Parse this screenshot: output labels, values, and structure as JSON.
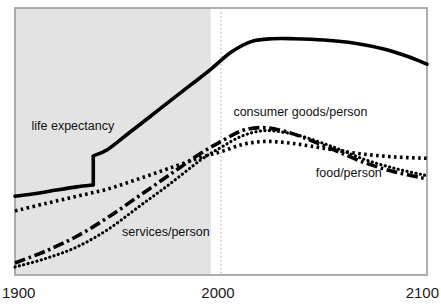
{
  "chart_data": {
    "type": "line",
    "title": "",
    "xlabel": "",
    "ylabel": "",
    "xlim": [
      1900,
      2100
    ],
    "ylim": [
      0,
      1
    ],
    "grid": "vertical dotted gridline at year 2000 only; no horizontal gridlines; no y-axis tick labels",
    "legend": "inline labels placed next to each curve",
    "x_ticks": [
      "1900",
      "2000",
      "2100"
    ],
    "shaded_region": {
      "label": "historical period shading",
      "from": 1900,
      "to": 1995,
      "color": "#e3e3e3"
    },
    "gridline_year": 2000,
    "series": [
      {
        "name": "life expectancy",
        "style": "solid-thick",
        "color": "#000000",
        "note": "step discontinuity near 1940",
        "x": [
          1900,
          1910,
          1920,
          1930,
          1938,
          1938,
          1945,
          1955,
          1965,
          1975,
          1985,
          1995,
          2005,
          2015,
          2025,
          2035,
          2050,
          2065,
          2080,
          2090,
          2100
        ],
        "values": [
          0.295,
          0.305,
          0.318,
          0.33,
          0.337,
          0.446,
          0.47,
          0.53,
          0.59,
          0.65,
          0.71,
          0.77,
          0.835,
          0.875,
          0.885,
          0.885,
          0.88,
          0.868,
          0.845,
          0.82,
          0.79
        ]
      },
      {
        "name": "food/person",
        "style": "dotted-bold",
        "color": "#000000",
        "x": [
          1900,
          1915,
          1930,
          1945,
          1960,
          1975,
          1990,
          2000,
          2010,
          2020,
          2030,
          2040,
          2055,
          2070,
          2085,
          2100
        ],
        "values": [
          0.24,
          0.268,
          0.295,
          0.322,
          0.36,
          0.4,
          0.44,
          0.462,
          0.488,
          0.5,
          0.497,
          0.487,
          0.468,
          0.452,
          0.442,
          0.437
        ]
      },
      {
        "name": "consumer goods/person",
        "style": "dash-dot-thick",
        "color": "#000000",
        "x": [
          1900,
          1915,
          1930,
          1945,
          1960,
          1975,
          1990,
          2000,
          2010,
          2020,
          2030,
          2040,
          2055,
          2070,
          2085,
          2100
        ],
        "values": [
          0.045,
          0.09,
          0.145,
          0.215,
          0.295,
          0.375,
          0.455,
          0.5,
          0.54,
          0.552,
          0.54,
          0.515,
          0.468,
          0.42,
          0.385,
          0.36
        ]
      },
      {
        "name": "services/person",
        "style": "dotted-fine",
        "color": "#000000",
        "x": [
          1900,
          1915,
          1930,
          1945,
          1960,
          1975,
          1990,
          2000,
          2010,
          2020,
          2030,
          2040,
          2055,
          2070,
          2085,
          2100
        ],
        "values": [
          0.03,
          0.062,
          0.105,
          0.17,
          0.255,
          0.34,
          0.43,
          0.478,
          0.52,
          0.54,
          0.535,
          0.518,
          0.478,
          0.432,
          0.398,
          0.372
        ]
      }
    ],
    "annotations": [
      {
        "text": "life expectancy",
        "x": 1908,
        "y": 0.545
      },
      {
        "text": "consumer goods/person",
        "x": 2006,
        "y": 0.595
      },
      {
        "text": "food/person",
        "x": 2046,
        "y": 0.368
      },
      {
        "text": "services/person",
        "x": 1952,
        "y": 0.148
      }
    ]
  },
  "axis": {
    "x_left": "1900",
    "x_mid": "2000",
    "x_right": "2100"
  },
  "series_labels": {
    "life_expectancy": "life expectancy",
    "consumer_goods": "consumer goods/person",
    "food": "food/person",
    "services": "services/person"
  },
  "colors": {
    "line": "#000000",
    "shading": "#e3e3e3",
    "border": "#9a9a9a",
    "gridline": "#b5b5b5",
    "text": "#1a1a1a"
  }
}
